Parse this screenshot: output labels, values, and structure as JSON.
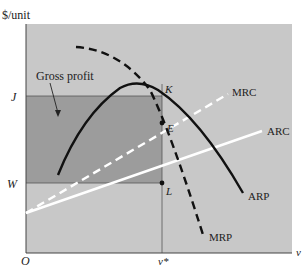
{
  "diagram": {
    "y_axis_label": "$/unit",
    "x_axis_label": "v",
    "origin_label": "O",
    "x_tick_label": "v*",
    "y_tick_labels": {
      "upper": "J",
      "lower": "W"
    },
    "region_label": "Gross profit",
    "point_labels": {
      "k": "K",
      "e": "E",
      "l": "L"
    },
    "curves": [
      {
        "name": "MRC",
        "style": "dashed",
        "color": "#ffffff"
      },
      {
        "name": "ARC",
        "style": "solid",
        "color": "#ffffff"
      },
      {
        "name": "ARP",
        "style": "solid",
        "color": "#111111"
      },
      {
        "name": "MRP",
        "style": "dashed",
        "color": "#111111"
      }
    ],
    "colors": {
      "plot_background": "#c8c8c8",
      "gross_profit_fill": "#9c9c9c",
      "axis": "#444444"
    }
  }
}
